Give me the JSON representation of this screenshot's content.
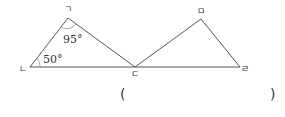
{
  "diagram": {
    "vertices": {
      "giyeok": {
        "label": "ㄱ",
        "x": 68,
        "y": 18
      },
      "nieun": {
        "label": "ㄴ",
        "x": 30,
        "y": 67
      },
      "digeut": {
        "label": "ㄷ",
        "x": 135,
        "y": 67
      },
      "mieum": {
        "label": "ㅁ",
        "x": 201,
        "y": 19
      },
      "rieul": {
        "label": "ㄹ",
        "x": 240,
        "y": 67
      }
    },
    "angles": {
      "at_giyeok": "95°",
      "at_nieun": "50°"
    },
    "line_color": "#555555"
  },
  "answer": {
    "open_paren": "(",
    "close_paren": ")",
    "value": ""
  }
}
